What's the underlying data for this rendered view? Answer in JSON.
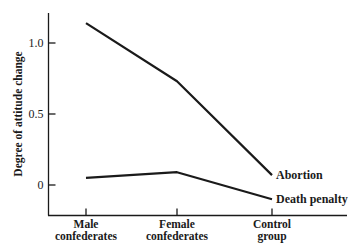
{
  "chart_data": {
    "type": "line",
    "title": "",
    "xlabel": "",
    "ylabel": "Degree of attitude change",
    "categories": [
      "Male confederates",
      "Female confederates",
      "Control group"
    ],
    "category_lines": [
      [
        "Male",
        "confederates"
      ],
      [
        "Female",
        "confederates"
      ],
      [
        "Control",
        "group"
      ]
    ],
    "y_ticks": [
      0,
      0.5,
      1.0
    ],
    "y_tick_labels": [
      "0",
      "0.5",
      "1.0"
    ],
    "ylim": [
      -0.21,
      1.21
    ],
    "grid": false,
    "legend": "direct labels at line ends (right)",
    "series": [
      {
        "name": "Abortion",
        "values": [
          1.14,
          0.73,
          0.07
        ]
      },
      {
        "name": "Death penalty",
        "values": [
          0.05,
          0.09,
          -0.1
        ]
      }
    ]
  },
  "colors": {
    "ink": "#1a1a1a",
    "background": "#ffffff"
  }
}
